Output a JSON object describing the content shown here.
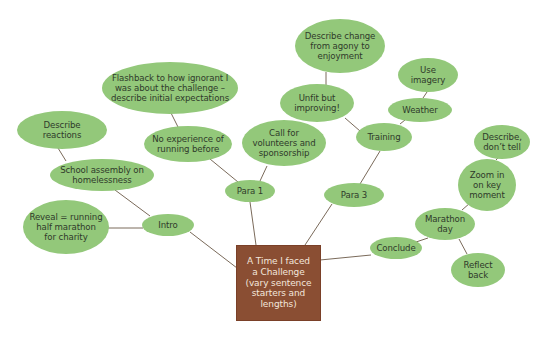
{
  "diagram": {
    "type": "mind-map",
    "colors": {
      "node_fill": "#93c87a",
      "central_fill": "#8a4e33",
      "central_text": "#f3e6dc",
      "node_text": "#2f3a2a",
      "link": "#7a6a5a",
      "background": "#ffffff"
    },
    "central": {
      "id": "central",
      "label": "A Time I faced\na Challenge\n(vary sentence\nstarters and\nlengths)",
      "x": 236,
      "y": 245,
      "w": 85,
      "h": 76
    },
    "nodes": [
      {
        "id": "intro",
        "label": "Intro",
        "cx": 168,
        "cy": 225,
        "w": 52,
        "h": 22
      },
      {
        "id": "school-assembly",
        "label": "School assembly on\nhomelessness",
        "cx": 102,
        "cy": 175,
        "w": 104,
        "h": 32
      },
      {
        "id": "describe-reactions",
        "label": "Describe\nreactions",
        "cx": 62,
        "cy": 130,
        "w": 90,
        "h": 38
      },
      {
        "id": "reveal",
        "label": "Reveal = running\nhalf marathon\nfor charity",
        "cx": 66,
        "cy": 227,
        "w": 86,
        "h": 54
      },
      {
        "id": "para-1",
        "label": "Para 1",
        "cx": 250,
        "cy": 191,
        "w": 50,
        "h": 22
      },
      {
        "id": "no-experience",
        "label": "No experience of\nrunning before",
        "cx": 188,
        "cy": 144,
        "w": 88,
        "h": 36
      },
      {
        "id": "flashback",
        "label": "Flashback to how ignorant I\nwas about the challenge –\ndescribe initial expectations",
        "cx": 170,
        "cy": 88,
        "w": 136,
        "h": 52
      },
      {
        "id": "call-for-volunteers",
        "label": "Call for\nvolunteers and\nsponsorship",
        "cx": 284,
        "cy": 143,
        "w": 84,
        "h": 46
      },
      {
        "id": "para-3",
        "label": "Para 3",
        "cx": 354,
        "cy": 195,
        "w": 60,
        "h": 24
      },
      {
        "id": "training",
        "label": "Training",
        "cx": 384,
        "cy": 137,
        "w": 56,
        "h": 28
      },
      {
        "id": "unfit-improving",
        "label": "Unfit but\nimproving!",
        "cx": 317,
        "cy": 103,
        "w": 74,
        "h": 38
      },
      {
        "id": "describe-change",
        "label": "Describe change\nfrom agony to\nenjoyment",
        "cx": 340,
        "cy": 46,
        "w": 90,
        "h": 54
      },
      {
        "id": "weather",
        "label": "Weather",
        "cx": 420,
        "cy": 110,
        "w": 64,
        "h": 24
      },
      {
        "id": "use-imagery",
        "label": "Use\nimagery",
        "cx": 428,
        "cy": 75,
        "w": 60,
        "h": 34
      },
      {
        "id": "conclude",
        "label": "Conclude",
        "cx": 396,
        "cy": 248,
        "w": 52,
        "h": 22
      },
      {
        "id": "marathon-day",
        "label": "Marathon\nday",
        "cx": 445,
        "cy": 224,
        "w": 60,
        "h": 32
      },
      {
        "id": "zoom-in",
        "label": "Zoom in\non key\nmoment",
        "cx": 487,
        "cy": 185,
        "w": 58,
        "h": 52
      },
      {
        "id": "describe-dont-tell",
        "label": "Describe,\ndon’t tell",
        "cx": 502,
        "cy": 142,
        "w": 56,
        "h": 34
      },
      {
        "id": "reflect-back",
        "label": "Reflect\nback",
        "cx": 478,
        "cy": 270,
        "w": 54,
        "h": 34
      }
    ],
    "links": [
      {
        "from": "central",
        "to": "intro",
        "x1": 237,
        "y1": 268,
        "x2": 190,
        "y2": 232
      },
      {
        "from": "central",
        "to": "para-1",
        "x1": 256,
        "y1": 245,
        "x2": 250,
        "y2": 202
      },
      {
        "from": "central",
        "to": "para-3",
        "x1": 305,
        "y1": 245,
        "x2": 332,
        "y2": 204
      },
      {
        "from": "central",
        "to": "conclude",
        "x1": 320,
        "y1": 260,
        "x2": 371,
        "y2": 255
      },
      {
        "from": "intro",
        "to": "school-assembly",
        "x1": 150,
        "y1": 216,
        "x2": 115,
        "y2": 190
      },
      {
        "from": "intro",
        "to": "reveal",
        "x1": 143,
        "y1": 228,
        "x2": 108,
        "y2": 228
      },
      {
        "from": "school-assembly",
        "to": "describe-reactions",
        "x1": 66,
        "y1": 161,
        "x2": 58,
        "y2": 148
      },
      {
        "from": "para-1",
        "to": "no-experience",
        "x1": 238,
        "y1": 182,
        "x2": 210,
        "y2": 159
      },
      {
        "from": "para-1",
        "to": "call-for-volunteers",
        "x1": 260,
        "y1": 181,
        "x2": 267,
        "y2": 166
      },
      {
        "from": "no-experience",
        "to": "flashback",
        "x1": 178,
        "y1": 127,
        "x2": 171,
        "y2": 113
      },
      {
        "from": "para-3",
        "to": "training",
        "x1": 360,
        "y1": 184,
        "x2": 380,
        "y2": 151
      },
      {
        "from": "training",
        "to": "unfit-improving",
        "x1": 360,
        "y1": 131,
        "x2": 345,
        "y2": 118
      },
      {
        "from": "training",
        "to": "weather",
        "x1": 400,
        "y1": 124,
        "x2": 405,
        "y2": 120
      },
      {
        "from": "unfit-improving",
        "to": "describe-change",
        "x1": 326,
        "y1": 85,
        "x2": 326,
        "y2": 72
      },
      {
        "from": "weather",
        "to": "use-imagery",
        "x1": 423,
        "y1": 98,
        "x2": 427,
        "y2": 92
      },
      {
        "from": "conclude",
        "to": "marathon-day",
        "x1": 416,
        "y1": 242,
        "x2": 428,
        "y2": 238
      },
      {
        "from": "marathon-day",
        "to": "zoom-in",
        "x1": 462,
        "y1": 210,
        "x2": 470,
        "y2": 203
      },
      {
        "from": "marathon-day",
        "to": "reflect-back",
        "x1": 459,
        "y1": 239,
        "x2": 467,
        "y2": 254
      },
      {
        "from": "zoom-in",
        "to": "describe-dont-tell",
        "x1": 496,
        "y1": 160,
        "x2": 498,
        "y2": 158
      }
    ]
  }
}
